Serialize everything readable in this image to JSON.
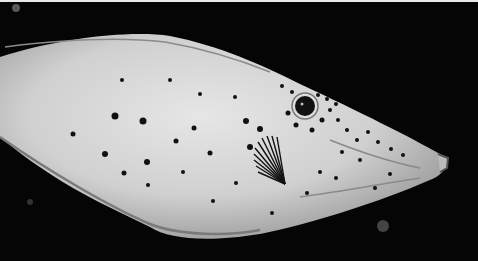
{
  "image": {
    "subject": "filefish",
    "description": "Grayscale photo of a spotted, scrawled filefish swimming right against a black background",
    "colors": {
      "background": "#050505",
      "body": "#d9d9d9",
      "body_shadow": "#9a9a9a",
      "spots": "#111111",
      "lines": "#7a7a7a",
      "top_border": "#e8e8e8"
    }
  }
}
